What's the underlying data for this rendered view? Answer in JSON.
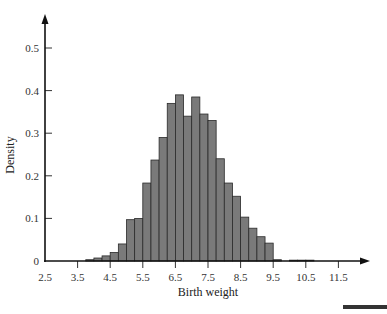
{
  "chart_data": {
    "type": "bar",
    "title": "",
    "xlabel": "Birth weight",
    "ylabel": "Density",
    "xlim": [
      2.5,
      12.5
    ],
    "ylim": [
      0,
      0.55
    ],
    "grid": false,
    "legend": null,
    "x_ticks": [
      "2.5",
      "3.5",
      "4.5",
      "5.5",
      "6.5",
      "7.5",
      "8.5",
      "9.5",
      "10.5",
      "11.5"
    ],
    "y_ticks": [
      "0",
      "0.1",
      "0.2",
      "0.3",
      "0.4",
      "0.5"
    ],
    "bin_width": 0.25,
    "bins": [
      {
        "start": 3.75,
        "end": 4.0,
        "density": 0.003
      },
      {
        "start": 4.0,
        "end": 4.25,
        "density": 0.007
      },
      {
        "start": 4.25,
        "end": 4.5,
        "density": 0.012
      },
      {
        "start": 4.5,
        "end": 4.75,
        "density": 0.02
      },
      {
        "start": 4.75,
        "end": 5.0,
        "density": 0.04
      },
      {
        "start": 5.0,
        "end": 5.25,
        "density": 0.097
      },
      {
        "start": 5.25,
        "end": 5.5,
        "density": 0.1
      },
      {
        "start": 5.5,
        "end": 5.75,
        "density": 0.183
      },
      {
        "start": 5.75,
        "end": 6.0,
        "density": 0.237
      },
      {
        "start": 6.0,
        "end": 6.25,
        "density": 0.29
      },
      {
        "start": 6.25,
        "end": 6.5,
        "density": 0.37
      },
      {
        "start": 6.5,
        "end": 6.75,
        "density": 0.39
      },
      {
        "start": 6.75,
        "end": 7.0,
        "density": 0.34
      },
      {
        "start": 7.0,
        "end": 7.25,
        "density": 0.385
      },
      {
        "start": 7.25,
        "end": 7.5,
        "density": 0.345
      },
      {
        "start": 7.5,
        "end": 7.75,
        "density": 0.33
      },
      {
        "start": 7.75,
        "end": 8.0,
        "density": 0.24
      },
      {
        "start": 8.0,
        "end": 8.25,
        "density": 0.183
      },
      {
        "start": 8.25,
        "end": 8.5,
        "density": 0.152
      },
      {
        "start": 8.5,
        "end": 8.75,
        "density": 0.103
      },
      {
        "start": 8.75,
        "end": 9.0,
        "density": 0.077
      },
      {
        "start": 9.0,
        "end": 9.25,
        "density": 0.057
      },
      {
        "start": 9.25,
        "end": 9.5,
        "density": 0.042
      },
      {
        "start": 9.5,
        "end": 9.75,
        "density": 0.003
      },
      {
        "start": 10.0,
        "end": 10.25,
        "density": 0.002
      },
      {
        "start": 10.25,
        "end": 10.5,
        "density": 0.002
      },
      {
        "start": 10.5,
        "end": 10.75,
        "density": 0.002
      }
    ]
  }
}
